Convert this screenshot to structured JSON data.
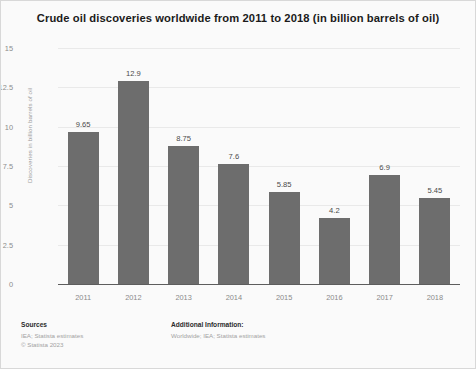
{
  "chart_data": {
    "type": "bar",
    "title": "Crude oil discoveries worldwide from 2011 to 2018 (in billion barrels of oil)",
    "xlabel": "",
    "ylabel": "Discoveries in billion barrels of oil",
    "categories": [
      "2011",
      "2012",
      "2013",
      "2014",
      "2015",
      "2016",
      "2017",
      "2018"
    ],
    "values": [
      9.65,
      12.9,
      8.75,
      7.6,
      5.85,
      4.2,
      6.9,
      5.45
    ],
    "value_labels": [
      "9.65",
      "12.9",
      "8.75",
      "7.6",
      "5.85",
      "4.2",
      "6.9",
      "5.45"
    ],
    "ylim": [
      0,
      15
    ],
    "yticks": [
      0,
      2.5,
      5,
      7.5,
      10,
      12.5,
      15
    ],
    "ytick_labels": [
      "0",
      "2.5",
      "5",
      "7.5",
      "10",
      "12.5",
      "15"
    ],
    "grid": true,
    "legend": "none",
    "bar_color": "#6d6d6d",
    "background_color": "#fafafa",
    "gridline_color": "#e9e9e9"
  },
  "footer": {
    "sources_heading": "Sources",
    "sources_lines": [
      "IEA; Statista estimates",
      "© Statista 2023"
    ],
    "additional_heading": "Additional Information:",
    "additional_lines": [
      "Worldwide; IEA; Statista estimates"
    ]
  }
}
